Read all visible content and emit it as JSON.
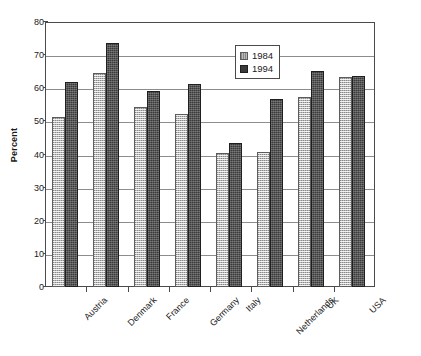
{
  "chart_data": {
    "type": "bar",
    "title": "",
    "xlabel": "",
    "ylabel": "Percent",
    "ylim": [
      0,
      80
    ],
    "yticks": [
      0,
      10,
      20,
      30,
      40,
      50,
      60,
      70,
      80
    ],
    "grid": "horizontal",
    "legend_position": "upper-center",
    "categories": [
      "Austria",
      "Denmark",
      "France",
      "Germany",
      "Italy",
      "Netherlands",
      "UK",
      "USA"
    ],
    "series": [
      {
        "name": "1984",
        "color": "#b9b9b9",
        "values": [
          51.5,
          65.0,
          54.5,
          52.5,
          40.5,
          41.0,
          57.5,
          63.5
        ]
      },
      {
        "name": "1994",
        "color": "#3a3a3a",
        "values": [
          62.0,
          74.0,
          59.5,
          61.5,
          43.5,
          57.0,
          65.5,
          64.0
        ]
      }
    ]
  },
  "axis": {
    "y_title": "Percent"
  },
  "legend": {
    "entries": [
      {
        "label": "1984",
        "swatch": "light-gray-swatch-icon"
      },
      {
        "label": "1994",
        "swatch": "dark-gray-swatch-icon"
      }
    ]
  }
}
